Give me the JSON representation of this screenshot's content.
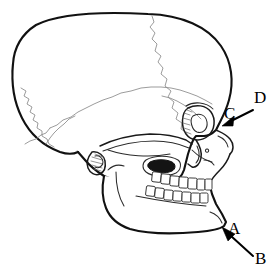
{
  "figure": {
    "background_color": "#ffffff",
    "line_color": "#111111",
    "suture_color": "#8a8a8a",
    "label_color": "#000000",
    "width_px": 277,
    "height_px": 279
  },
  "labels": [
    {
      "id": "A",
      "text": "A",
      "x": 228,
      "y": 220,
      "has_arrow": false,
      "description": "label at mandible angle"
    },
    {
      "id": "B",
      "text": "B",
      "x": 255,
      "y": 250,
      "has_arrow": true,
      "description": "label with arrow pointing up-left to the chin / mandible corner"
    },
    {
      "id": "C",
      "text": "C",
      "x": 224,
      "y": 105,
      "has_arrow": false,
      "description": "label above arrowhead at nasal bridge"
    },
    {
      "id": "D",
      "text": "D",
      "x": 254,
      "y": 89,
      "has_arrow": true,
      "description": "label with arrow pointing down-left to the nasal bone region"
    }
  ],
  "arrows": [
    {
      "id": "arrow-d",
      "from_label": "D",
      "tail_x": 253,
      "tail_y": 111,
      "tip_x": 222,
      "tip_y": 126,
      "points_to": "nasal-bone"
    },
    {
      "id": "arrow-b",
      "from_label": "B",
      "tail_x": 253,
      "tail_y": 256,
      "tip_x": 222,
      "tip_y": 227,
      "points_to": "mandible-angle"
    }
  ],
  "anatomy": [
    {
      "name": "cranium",
      "label": "cranial vault"
    },
    {
      "name": "coronal-suture",
      "label": "coronal suture"
    },
    {
      "name": "lambdoid-suture",
      "label": "lambdoid suture"
    },
    {
      "name": "squamous-suture",
      "label": "squamous suture"
    },
    {
      "name": "orbit",
      "label": "orbit"
    },
    {
      "name": "zygomatic-arch",
      "label": "zygomatic arch"
    },
    {
      "name": "nasal-aperture",
      "label": "nasal aperture"
    },
    {
      "name": "maxilla",
      "label": "maxilla"
    },
    {
      "name": "mandible",
      "label": "mandible"
    },
    {
      "name": "mastoid-process",
      "label": "mastoid process"
    },
    {
      "name": "upper-teeth",
      "label": "upper teeth"
    },
    {
      "name": "lower-teeth",
      "label": "lower teeth"
    }
  ]
}
